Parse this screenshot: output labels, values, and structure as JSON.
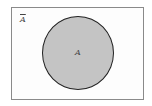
{
  "diagram": {
    "type": "venn",
    "universal_set": {
      "shape": "rectangle",
      "fill": "#fdfdfd",
      "border": "#8a8a8a"
    },
    "sets": [
      {
        "label": "A",
        "shape": "circle",
        "fill": "#c4c4c4",
        "border": "#222222",
        "shaded": true
      }
    ],
    "complement_label": "A",
    "complement_notation": "overline"
  }
}
